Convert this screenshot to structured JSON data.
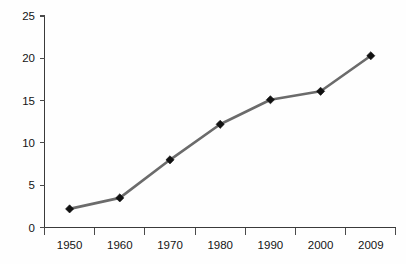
{
  "chart_data": {
    "type": "line",
    "title": "",
    "subtitle": "",
    "xlabel": "",
    "ylabel": "",
    "categories": [
      "1950",
      "1960",
      "1970",
      "1980",
      "1990",
      "2000",
      "2009"
    ],
    "values": [
      2.2,
      3.5,
      8.0,
      12.2,
      15.1,
      16.1,
      20.3
    ],
    "series": [
      {
        "name": "",
        "values": [
          2.2,
          3.5,
          8.0,
          12.2,
          15.1,
          16.1,
          20.3
        ]
      }
    ],
    "ylim": [
      0,
      25
    ],
    "yticks": [
      0,
      5,
      10,
      15,
      20,
      25
    ],
    "ytick_labels": [
      "0",
      "5",
      "10",
      "15",
      "20",
      "25"
    ],
    "xtick_labels": [
      "1950",
      "1960",
      "1970",
      "1980",
      "1990",
      "2000",
      "2009"
    ],
    "grid": false,
    "legend": false,
    "legend_position": "none",
    "marker": "diamond",
    "line_color": "#6b6b6b",
    "marker_color": "#111111",
    "axis_color": "#3a3a3a",
    "background_color": "#fefefe",
    "text_color": "#141414"
  },
  "labels": {
    "y": {
      "t0": "0",
      "t1": "5",
      "t2": "10",
      "t3": "15",
      "t4": "20",
      "t5": "25"
    },
    "x": {
      "c0": "1950",
      "c1": "1960",
      "c2": "1970",
      "c3": "1980",
      "c4": "1990",
      "c5": "2000",
      "c6": "2009"
    }
  }
}
